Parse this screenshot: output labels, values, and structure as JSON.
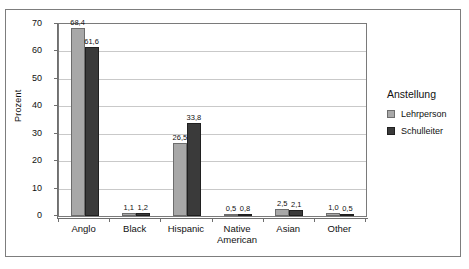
{
  "chart_data": {
    "type": "bar",
    "title": "",
    "xlabel": "",
    "ylabel": "Prozent",
    "ylim": [
      0,
      70
    ],
    "ytick_step": 10,
    "yticks": [
      "0",
      "10",
      "20",
      "30",
      "40",
      "50",
      "60",
      "70"
    ],
    "grid": true,
    "decimal_separator": ",",
    "legend": {
      "position": "right",
      "title": "Anstellung",
      "entries": [
        {
          "label": "Lehrperson",
          "color": "#a8a8a8"
        },
        {
          "label": "Schulleiter",
          "color": "#3a3a3a"
        }
      ]
    },
    "categories": [
      "Anglo",
      "Black",
      "Hispanic",
      "Native American",
      "Asian",
      "Other"
    ],
    "category_lines": [
      [
        "Anglo"
      ],
      [
        "Black"
      ],
      [
        "Hispanic"
      ],
      [
        "Native",
        "American"
      ],
      [
        "Asian"
      ],
      [
        "Other"
      ]
    ],
    "series": [
      {
        "name": "Lehrperson",
        "color": "#a8a8a8",
        "values": [
          68.4,
          1.1,
          26.5,
          0.5,
          2.5,
          1.0
        ],
        "labels": [
          "68,4",
          "1,1",
          "26,5",
          "0,5",
          "2,5",
          "1,0"
        ]
      },
      {
        "name": "Schulleiter",
        "color": "#3a3a3a",
        "values": [
          61.6,
          1.2,
          33.8,
          0.8,
          2.1,
          0.5
        ],
        "labels": [
          "61,6",
          "1,2",
          "33,8",
          "0,8",
          "2,1",
          "0,5"
        ]
      }
    ]
  }
}
